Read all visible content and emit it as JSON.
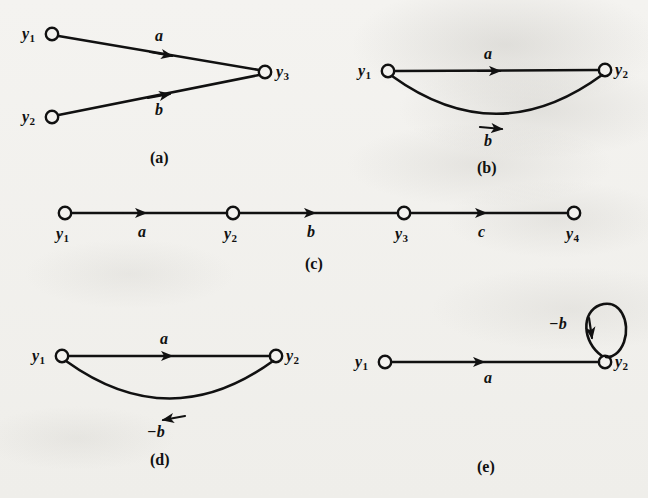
{
  "figure": {
    "background_color": "#f3f2ef",
    "ink_color": "#111111",
    "panels": [
      {
        "id": "a",
        "caption": "(a)",
        "nodes": [
          {
            "name": "y1",
            "base": "y",
            "subscript": "1"
          },
          {
            "name": "y2",
            "base": "y",
            "subscript": "2"
          },
          {
            "name": "y3",
            "base": "y",
            "subscript": "3"
          }
        ],
        "edges": [
          {
            "from": "y1",
            "to": "y3",
            "label": "a",
            "shape": "straight",
            "direction": "right"
          },
          {
            "from": "y2",
            "to": "y3",
            "label": "b",
            "shape": "straight",
            "direction": "right"
          }
        ]
      },
      {
        "id": "b",
        "caption": "(b)",
        "nodes": [
          {
            "name": "y1",
            "base": "y",
            "subscript": "1"
          },
          {
            "name": "y2",
            "base": "y",
            "subscript": "2"
          }
        ],
        "edges": [
          {
            "from": "y1",
            "to": "y2",
            "label": "a",
            "shape": "straight",
            "direction": "right"
          },
          {
            "from": "y1",
            "to": "y2",
            "label": "b",
            "shape": "curve-below",
            "direction": "right"
          }
        ]
      },
      {
        "id": "c",
        "caption": "(c)",
        "nodes": [
          {
            "name": "y1",
            "base": "y",
            "subscript": "1"
          },
          {
            "name": "y2",
            "base": "y",
            "subscript": "2"
          },
          {
            "name": "y3",
            "base": "y",
            "subscript": "3"
          },
          {
            "name": "y4",
            "base": "y",
            "subscript": "4"
          }
        ],
        "edges": [
          {
            "from": "y1",
            "to": "y2",
            "label": "a",
            "shape": "straight",
            "direction": "right"
          },
          {
            "from": "y2",
            "to": "y3",
            "label": "b",
            "shape": "straight",
            "direction": "right"
          },
          {
            "from": "y3",
            "to": "y4",
            "label": "c",
            "shape": "straight",
            "direction": "right"
          }
        ]
      },
      {
        "id": "d",
        "caption": "(d)",
        "nodes": [
          {
            "name": "y1",
            "base": "y",
            "subscript": "1"
          },
          {
            "name": "y2",
            "base": "y",
            "subscript": "2"
          }
        ],
        "edges": [
          {
            "from": "y1",
            "to": "y2",
            "label": "a",
            "shape": "straight",
            "direction": "right"
          },
          {
            "from": "y2",
            "to": "y1",
            "label": "−b",
            "shape": "curve-below",
            "direction": "left"
          }
        ]
      },
      {
        "id": "e",
        "caption": "(e)",
        "nodes": [
          {
            "name": "y1",
            "base": "y",
            "subscript": "1"
          },
          {
            "name": "y2",
            "base": "y",
            "subscript": "2"
          }
        ],
        "edges": [
          {
            "from": "y1",
            "to": "y2",
            "label": "a",
            "shape": "straight",
            "direction": "right"
          },
          {
            "from": "y2",
            "to": "y2",
            "label": "−b",
            "shape": "self-loop",
            "direction": "down"
          }
        ]
      }
    ]
  },
  "labels": {
    "a": {
      "node_y1": "y",
      "node_y1_sub": "1",
      "node_y2": "y",
      "node_y2_sub": "2",
      "node_y3": "y",
      "node_y3_sub": "3",
      "edge_a": "a",
      "edge_b": "b",
      "caption": "(a)"
    },
    "b": {
      "node_y1": "y",
      "node_y1_sub": "1",
      "node_y2": "y",
      "node_y2_sub": "2",
      "edge_a": "a",
      "edge_b": "b",
      "caption": "(b)"
    },
    "c": {
      "node_y1": "y",
      "node_y1_sub": "1",
      "node_y2": "y",
      "node_y2_sub": "2",
      "node_y3": "y",
      "node_y3_sub": "3",
      "node_y4": "y",
      "node_y4_sub": "4",
      "edge_a": "a",
      "edge_b": "b",
      "edge_c": "c",
      "caption": "(c)"
    },
    "d": {
      "node_y1": "y",
      "node_y1_sub": "1",
      "node_y2": "y",
      "node_y2_sub": "2",
      "edge_a": "a",
      "edge_nb": "−b",
      "caption": "(d)"
    },
    "e": {
      "node_y1": "y",
      "node_y1_sub": "1",
      "node_y2": "y",
      "node_y2_sub": "2",
      "edge_a": "a",
      "edge_nb": "−b",
      "caption": "(e)"
    }
  }
}
